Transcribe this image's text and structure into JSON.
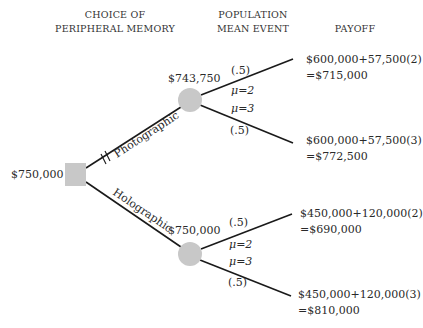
{
  "headers": {
    "choice": [
      "CHOICE OF",
      "PERIPHERAL MEMORY"
    ],
    "event": [
      "POPULATION",
      "MEAN EVENT"
    ],
    "payoff": "PAYOFF"
  },
  "root": {
    "value": "$750,000",
    "shape": "square"
  },
  "decisions": [
    {
      "label": "Photographic",
      "blocked": true,
      "chance_node": {
        "value": "$743,750",
        "outcomes": [
          {
            "prob": "(.5)",
            "event": "μ=2",
            "payoff_line1": "$600,000+57,500(2)",
            "payoff_line2": "=$715,000"
          },
          {
            "prob": "(.5)",
            "event": "μ=3",
            "payoff_line1": "$600,000+57,500(3)",
            "payoff_line2": "=$772,500"
          }
        ]
      }
    },
    {
      "label": "Holographic",
      "blocked": false,
      "chance_node": {
        "value": "$750,000",
        "outcomes": [
          {
            "prob": "(.5)",
            "event": "μ=2",
            "payoff_line1": "$450,000+120,000(2)",
            "payoff_line2": "=$690,000"
          },
          {
            "prob": "(.5)",
            "event": "μ=3",
            "payoff_line1": "$450,000+120,000(3)",
            "payoff_line2": "=$810,000"
          }
        ]
      }
    }
  ],
  "colors": {
    "node_fill": "#c8c8c8",
    "line": "#1a1a1a"
  }
}
